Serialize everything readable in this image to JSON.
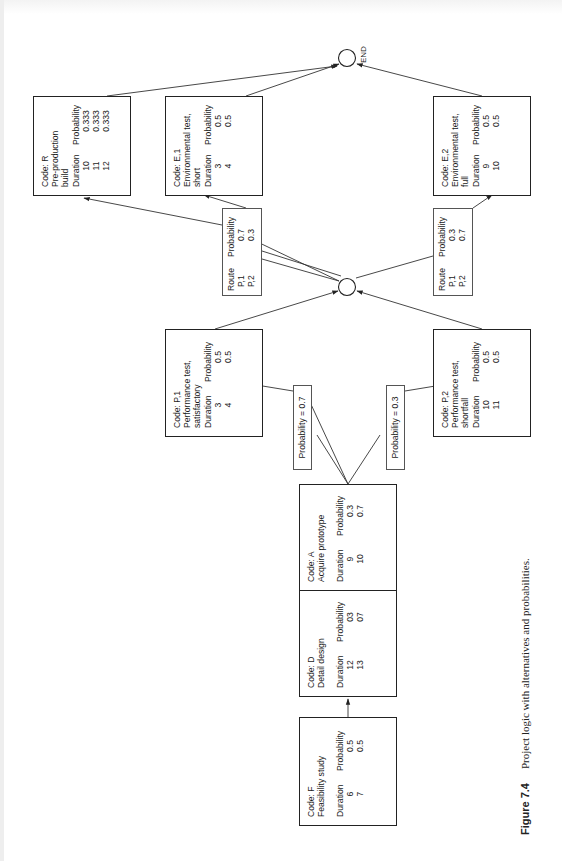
{
  "figure": {
    "number": "Figure 7.4",
    "caption": "Project logic with alternatives and probabilities.",
    "orientation": "rotated 90° counter-clockwise"
  },
  "headers": {
    "duration": "Duration",
    "probability": "Probability",
    "route": "Route"
  },
  "activities": {
    "F": {
      "code": "Code: F",
      "name": "Feasibility study",
      "rows": [
        {
          "duration": "6",
          "probability": "0.5"
        },
        {
          "duration": "7",
          "probability": "0.5"
        }
      ]
    },
    "D": {
      "code": "Code: D",
      "name": "Detail design",
      "rows": [
        {
          "duration": "12",
          "probability": "03"
        },
        {
          "duration": "13",
          "probability": "07"
        }
      ]
    },
    "A": {
      "code": "Code: A",
      "name": "Acquire prototype",
      "rows": [
        {
          "duration": "9",
          "probability": "0.3"
        },
        {
          "duration": "10",
          "probability": "0.7"
        }
      ]
    },
    "P1": {
      "code": "Code: P,1",
      "name": "Performance test,\n                satisfactory",
      "rows": [
        {
          "duration": "3",
          "probability": "0.5"
        },
        {
          "duration": "4",
          "probability": "0.5"
        }
      ]
    },
    "P2": {
      "code": "Code: P,2",
      "name": "Performance test,\n                 shortfall",
      "rows": [
        {
          "duration": "10",
          "probability": "0.5"
        },
        {
          "duration": "11",
          "probability": "0.5"
        }
      ]
    },
    "R": {
      "code": "Code: R",
      "name": "Pre-production\n                 build",
      "rows": [
        {
          "duration": "10",
          "probability": "0.333"
        },
        {
          "duration": "11",
          "probability": "0.333"
        },
        {
          "duration": "12",
          "probability": "0.333"
        }
      ]
    },
    "E1": {
      "code": "Code: E,1",
      "name": "Environmental test,\n                    short",
      "rows": [
        {
          "duration": "3",
          "probability": "0.5"
        },
        {
          "duration": "4",
          "probability": "0.5"
        }
      ]
    },
    "E2": {
      "code": "Code: E,2",
      "name": "Environmental test,\n                      full",
      "rows": [
        {
          "duration": "9",
          "probability": "0.5"
        },
        {
          "duration": "10",
          "probability": "0.5"
        }
      ]
    }
  },
  "branch_labels": {
    "to_P1": "Probability = 0.7",
    "to_P2": "Probability = 0.3"
  },
  "route_tables": {
    "to_E1": {
      "rows": [
        {
          "route": "P,1",
          "probability": "0.7"
        },
        {
          "route": "P,2",
          "probability": "0.3"
        }
      ]
    },
    "to_E2": {
      "rows": [
        {
          "route": "P,1",
          "probability": "0.3"
        },
        {
          "route": "P,2",
          "probability": "0.7"
        }
      ]
    }
  },
  "nodes": {
    "end_label": "END"
  },
  "colors": {
    "line": "#333333",
    "box_border": "#222222",
    "background": "#ffffff"
  }
}
